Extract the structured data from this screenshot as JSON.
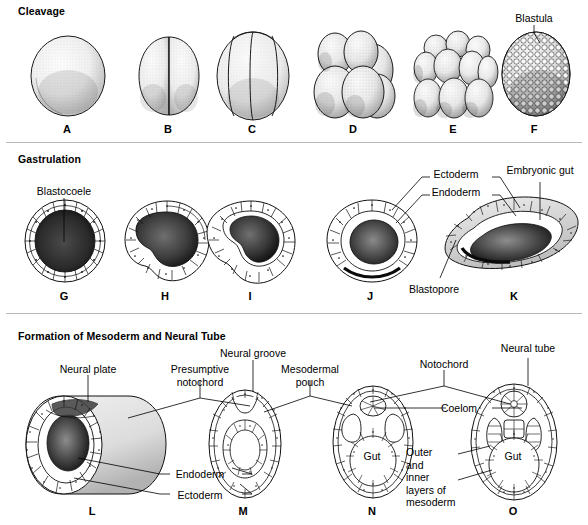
{
  "figure": {
    "width": 588,
    "height": 525,
    "ink_color": "#000000",
    "background": "#ffffff"
  },
  "sections": [
    {
      "id": "cleavage",
      "heading": "Cleavage",
      "heading_pos": {
        "x": 18,
        "y": 5
      },
      "stages": [
        {
          "letter": "A",
          "x": 67,
          "y": 123,
          "desc": "zygote-single-cell"
        },
        {
          "letter": "B",
          "x": 168,
          "y": 123,
          "desc": "two-cell-stage"
        },
        {
          "letter": "C",
          "x": 252,
          "y": 123,
          "desc": "four-cell-stage"
        },
        {
          "letter": "D",
          "x": 353,
          "y": 123,
          "desc": "eight-cell-stage"
        },
        {
          "letter": "E",
          "x": 453,
          "y": 123,
          "desc": "sixteen-cell-morula"
        },
        {
          "letter": "F",
          "x": 534,
          "y": 123,
          "desc": "blastula-many-cells"
        }
      ],
      "callouts": [
        {
          "text": "Blastula",
          "x": 534,
          "y": 12,
          "align": "center",
          "name": "label-blastula"
        }
      ]
    },
    {
      "id": "gastrulation",
      "heading": "Gastrulation",
      "heading_pos": {
        "x": 18,
        "y": 153
      },
      "stages": [
        {
          "letter": "G",
          "x": 64,
          "y": 290,
          "desc": "blastula-cross-section"
        },
        {
          "letter": "H",
          "x": 165,
          "y": 290,
          "desc": "early-invagination"
        },
        {
          "letter": "I",
          "x": 250,
          "y": 290,
          "desc": "mid-invagination"
        },
        {
          "letter": "J",
          "x": 370,
          "y": 290,
          "desc": "late-gastrula"
        },
        {
          "letter": "K",
          "x": 514,
          "y": 290,
          "desc": "gastrula-with-archenteron"
        }
      ],
      "callouts": [
        {
          "text": "Blastocoele",
          "x": 64,
          "y": 185,
          "align": "center",
          "name": "label-blastocoele"
        },
        {
          "text": "Ectoderm",
          "x": 456,
          "y": 168,
          "align": "center",
          "name": "label-ectoderm-gastrula"
        },
        {
          "text": "Endoderm",
          "x": 456,
          "y": 186,
          "align": "center",
          "name": "label-endoderm-gastrula"
        },
        {
          "text": "Embryonic gut",
          "x": 540,
          "y": 164,
          "align": "center",
          "name": "label-embryonic-gut"
        },
        {
          "text": "Blastopore",
          "x": 434,
          "y": 283,
          "align": "center",
          "name": "label-blastopore"
        }
      ]
    },
    {
      "id": "mesoderm-neural-tube",
      "heading": "Formation of Mesoderm and Neural Tube",
      "heading_pos": {
        "x": 18,
        "y": 330
      },
      "stages": [
        {
          "letter": "L",
          "x": 92,
          "y": 505,
          "desc": "neurula-surface-view"
        },
        {
          "letter": "M",
          "x": 243,
          "y": 505,
          "desc": "neural-groove-cross-section"
        },
        {
          "letter": "N",
          "x": 372,
          "y": 505,
          "desc": "mesodermal-pouch-cross-section"
        },
        {
          "letter": "O",
          "x": 513,
          "y": 505,
          "desc": "neural-tube-cross-section"
        }
      ],
      "callouts": [
        {
          "text": "Neural plate",
          "x": 88,
          "y": 363,
          "align": "center",
          "name": "label-neural-plate"
        },
        {
          "text": "Presumptive\nnotochord",
          "x": 200,
          "y": 363,
          "align": "center",
          "name": "label-presumptive-notochord"
        },
        {
          "text": "Neural groove",
          "x": 253,
          "y": 347,
          "align": "center",
          "name": "label-neural-groove"
        },
        {
          "text": "Mesodermal\npouch",
          "x": 310,
          "y": 363,
          "align": "center",
          "name": "label-mesodermal-pouch"
        },
        {
          "text": "Notochord",
          "x": 444,
          "y": 358,
          "align": "center",
          "name": "label-notochord"
        },
        {
          "text": "Neural tube",
          "x": 528,
          "y": 342,
          "align": "center",
          "name": "label-neural-tube"
        },
        {
          "text": "Coelom",
          "x": 459,
          "y": 408,
          "align": "center",
          "name": "label-coelom"
        },
        {
          "text": "Gut",
          "x": 372,
          "y": 455,
          "align": "center",
          "name": "label-gut-n"
        },
        {
          "text": "Gut",
          "x": 513,
          "y": 455,
          "align": "center",
          "name": "label-gut-o"
        },
        {
          "text": "Endoderm",
          "x": 200,
          "y": 468,
          "align": "center",
          "name": "label-endoderm-neurula"
        },
        {
          "text": "Ectoderm",
          "x": 200,
          "y": 489,
          "align": "center",
          "name": "label-ectoderm-neurula"
        },
        {
          "text": "Outer\nand\ninner\nlayers of\nmesoderm",
          "x": 406,
          "y": 448,
          "align": "left",
          "name": "label-mesoderm-layers"
        }
      ]
    }
  ]
}
